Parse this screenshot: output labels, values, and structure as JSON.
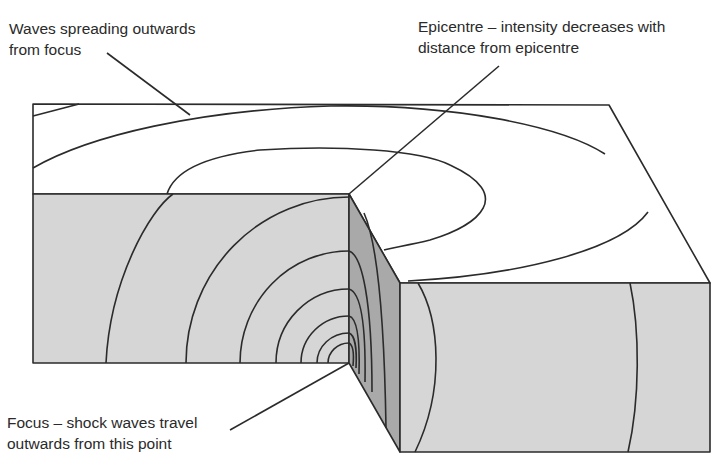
{
  "diagram": {
    "labels": {
      "waves": {
        "line1": "Waves spreading outwards",
        "line2": "from focus"
      },
      "epicentre": {
        "line1": "Epicentre – intensity decreases with",
        "line2": "distance from epicentre"
      },
      "focus": {
        "line1": "Focus – shock waves travel",
        "line2": "outwards from this point"
      }
    },
    "colors": {
      "top_face": "#ffffff",
      "front_face": "#d6d6d6",
      "cut_face": "#a9a9a9",
      "line": "#2b2b2b"
    }
  }
}
